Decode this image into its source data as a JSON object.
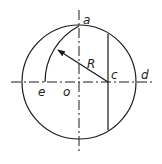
{
  "diagram": {
    "type": "geometric-construction",
    "stroke_color": "#1a1a1a",
    "background": "#ffffff",
    "labels": {
      "a": "a",
      "R": "R",
      "c": "c",
      "d": "d",
      "e": "e",
      "o": "o"
    },
    "geometry": {
      "circle": {
        "cx": 79,
        "cy": 82,
        "r": 57
      },
      "point_c": {
        "x": 108,
        "y": 82
      },
      "point_a": {
        "x": 79,
        "y": 26
      },
      "point_e": {
        "x": 45,
        "y": 82
      },
      "arc_radius_R": 63
    }
  }
}
